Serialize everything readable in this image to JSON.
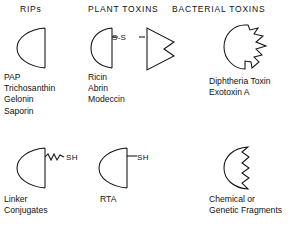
{
  "figure": {
    "type": "diagram",
    "background_color": "#ffffff",
    "line_color": "#111111",
    "title": ""
  },
  "columns": [
    {
      "id": "rips",
      "header": "RIPs",
      "top": {
        "shape_name": "half-disc-a-chain",
        "labels": [
          "PAP",
          "Trichosanthin",
          "Gelonin",
          "Saporin"
        ]
      },
      "bottom": {
        "shape_name": "half-disc-with-squiggle-linker-sh",
        "bond_label": "SH",
        "labels": [
          "Linker",
          "Conjugates"
        ]
      }
    },
    {
      "id": "plant_toxins",
      "header": "PLANT TOXINS",
      "top": {
        "shape_name": "half-disc-disulfide-notched-triangle",
        "bond_label": "S-S",
        "labels": [
          "Ricin",
          "Abrin",
          "Modeccin"
        ]
      },
      "bottom": {
        "shape_name": "half-disc-with-straight-linker-sh",
        "bond_label": "SH",
        "labels": [
          "RTA"
        ]
      }
    },
    {
      "id": "bacterial_toxins",
      "header": "BACTERIAL TOXINS",
      "top": {
        "shape_name": "blob-with-jagged-right-edge",
        "labels": [
          "Diphtheria Toxin",
          "Exotoxin A"
        ]
      },
      "bottom": {
        "shape_name": "half-disc-with-zigzag-right-edge",
        "labels": [
          "Chemical or",
          "Genetic Fragments"
        ]
      }
    }
  ]
}
